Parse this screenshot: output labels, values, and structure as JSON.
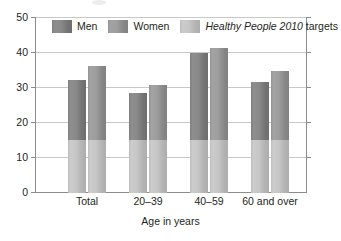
{
  "chart_data": {
    "type": "bar",
    "title": "",
    "xlabel": "Age in years",
    "ylabel": "",
    "categories": [
      "Total",
      "20–39",
      "40–59",
      "60 and over"
    ],
    "series": [
      {
        "name": "Men",
        "values": [
          32.0,
          28.5,
          39.9,
          31.4
        ]
      },
      {
        "name": "Women",
        "values": [
          36.2,
          30.8,
          41.2,
          34.6
        ]
      }
    ],
    "reference_band": {
      "name": "Healthy People 2010 targets",
      "value": 15
    },
    "ylim": [
      0,
      50
    ],
    "yticks": [
      0,
      10,
      20,
      30,
      40,
      50
    ],
    "ytick_labels": [
      "0",
      "10",
      "20",
      "30",
      "40",
      "50"
    ],
    "grid": true,
    "legend_position": "top-inside",
    "colors": {
      "men": "#898989",
      "women": "#9d9d9d",
      "target": "#c6c6c6",
      "axis": "#8c8c8c",
      "gridline": "#c9c9c9",
      "text": "#231f20",
      "background": "#ffffff"
    }
  },
  "legend": {
    "items": [
      {
        "label": "Men",
        "italic_prefix": "",
        "plain": "Men"
      },
      {
        "label": "Women",
        "italic_prefix": "",
        "plain": "Women"
      },
      {
        "label": "Healthy People 2010 targets",
        "italic_prefix": "Healthy People 2010",
        "plain": " targets"
      }
    ]
  },
  "axes": {
    "y_labels": [
      "50",
      "40",
      "30",
      "20",
      "10",
      "0"
    ],
    "x_labels": [
      "Total",
      "20–39",
      "40–59",
      "60 and over"
    ],
    "x_axis_title": "Age in years"
  }
}
